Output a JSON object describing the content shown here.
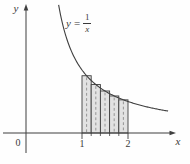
{
  "figure": {
    "ink_color": "#3f3f3f",
    "rect_fill_color": "#e2e2e2",
    "dash_color": "#8c8c8c"
  },
  "function_label": {
    "lhs": "y",
    "eq": "=",
    "numerator": "1",
    "denominator": "x"
  },
  "chart_data": {
    "type": "line",
    "title": "",
    "xlabel": "x",
    "ylabel": "y",
    "origin_label": "0",
    "curve": {
      "expression": "y = 1/x",
      "x_start": 0.492,
      "x_end": 2.88
    },
    "x_ticks": [
      {
        "value": 1,
        "label": "1"
      },
      {
        "value": 2,
        "label": "2"
      }
    ],
    "riemann": {
      "method": "midpoint",
      "interval": [
        1,
        2
      ],
      "n": 5,
      "width": 0.2,
      "midpoints": [
        1.1,
        1.3,
        1.5,
        1.7,
        1.9
      ],
      "heights": [
        0.909,
        0.769,
        0.667,
        0.588,
        0.526
      ]
    },
    "axes": {
      "x_range": [
        -0.45,
        3.0
      ],
      "y_range": [
        0,
        2.05
      ],
      "grid": false,
      "legend": false
    }
  }
}
